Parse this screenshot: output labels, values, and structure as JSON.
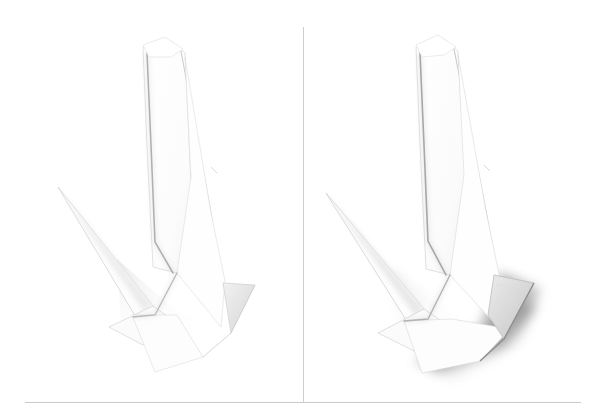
{
  "figure": {
    "type": "origami-instruction-photo-pair",
    "background_color": "#ffffff",
    "rule_color": "#c9c9c9",
    "divider_color": "#cdcdcd",
    "badge_background": "#8c8c8c",
    "badge_text_color": "#ffffff"
  },
  "panels": [
    {
      "id": "panel-left",
      "step_label": "5",
      "subject": "white folded paper model photographed on white background",
      "shadow_intensity": "light",
      "accent_flap_color": "#e2e2e2"
    },
    {
      "id": "panel-right",
      "step_label": "6",
      "subject": "white folded paper model photographed on white background",
      "shadow_intensity": "strong",
      "accent_flap_color": "#d3d3d3"
    }
  ]
}
